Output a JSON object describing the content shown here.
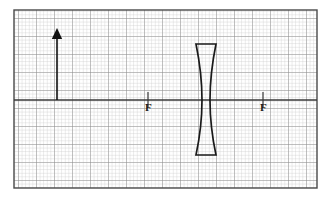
{
  "figure": {
    "kind": "optics-ray-diagram",
    "background_color": "#ffffff",
    "border_color": "#4a4a4a"
  },
  "grid": {
    "minor_spacing_px": 3.6,
    "major_spacing_px": 18,
    "minor_color": "#c9c9c9",
    "major_color": "#8a8a8a",
    "area": {
      "x": 14,
      "y": 10,
      "width": 303,
      "height": 178
    },
    "grid_on": true
  },
  "principal_axis": {
    "label": "principal-axis",
    "color": "#3a3a3a",
    "y": 100,
    "x_start": 14,
    "x_end": 317
  },
  "lens": {
    "type": "concave",
    "label": "diverging-lens",
    "color": "#1a1a1a",
    "center_x": 206,
    "top_y": 44,
    "bottom_y": 155,
    "top_half_width": 10,
    "waist_half_width": 4
  },
  "object_arrow": {
    "label": "object-arrow",
    "color": "#111111",
    "x": 57,
    "tail_y": 100,
    "tip_y": 29,
    "direction": "up"
  },
  "focal_points": [
    {
      "id": "f-left",
      "text": "F",
      "x": 148,
      "y": 100,
      "side": "left"
    },
    {
      "id": "f-right",
      "text": "F",
      "x": 263,
      "y": 100,
      "side": "right"
    }
  ],
  "focal_ticks": [
    {
      "x": 148,
      "y_top": 92,
      "y_bottom": 108
    },
    {
      "x": 263,
      "y_top": 92,
      "y_bottom": 108
    }
  ]
}
